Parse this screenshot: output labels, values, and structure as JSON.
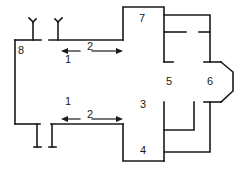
{
  "diagram": {
    "type": "floor-plan",
    "stroke_color": "#1a1a1a",
    "background": "#ffffff",
    "labels": {
      "area_1_top": "1",
      "area_1_bottom": "1",
      "area_2_top": "2",
      "area_2_bottom": "2",
      "area_3": "3",
      "area_4": "4",
      "area_5": "5",
      "area_6": "6",
      "area_7": "7",
      "area_8": "8"
    },
    "arrows": [
      {
        "label": "2",
        "direction": "double",
        "position": "upper nave"
      },
      {
        "label": "2",
        "direction": "double",
        "position": "lower nave"
      }
    ]
  }
}
